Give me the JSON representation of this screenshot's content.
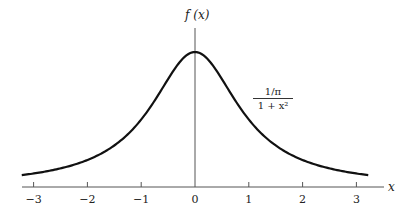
{
  "chart_data": {
    "type": "line",
    "title": "",
    "function": "f(x) = (1/π) / (1 + x²)",
    "xlabel": "x",
    "ylabel": "f (x)",
    "curve_label": {
      "numerator": "1/π",
      "denominator": "1 + x²"
    },
    "xlim": [
      -3.3,
      3.5
    ],
    "ylim": [
      0,
      0.33
    ],
    "x_ticks": [
      -3,
      -2,
      -1,
      0,
      1,
      2,
      3
    ],
    "x_tick_labels": [
      "−3",
      "−2",
      "−1",
      "0",
      "1",
      "2",
      "3"
    ],
    "grid": false,
    "series": [
      {
        "name": "Cauchy density",
        "x": [
          -3.2,
          -3,
          -2.5,
          -2,
          -1.5,
          -1,
          -0.5,
          0,
          0.5,
          1,
          1.5,
          2,
          2.5,
          3,
          3.2
        ],
        "values": [
          0.0284,
          0.0318,
          0.0439,
          0.0637,
          0.0979,
          0.1592,
          0.2546,
          0.3183,
          0.2546,
          0.1592,
          0.0979,
          0.0637,
          0.0439,
          0.0318,
          0.0284
        ]
      }
    ]
  },
  "labels": {
    "y_axis": "f (x)",
    "x_axis": "x",
    "numerator": "1/π",
    "denominator": "1 + x²"
  },
  "ticks": [
    "−3",
    "−2",
    "−1",
    "0",
    "1",
    "2",
    "3"
  ]
}
